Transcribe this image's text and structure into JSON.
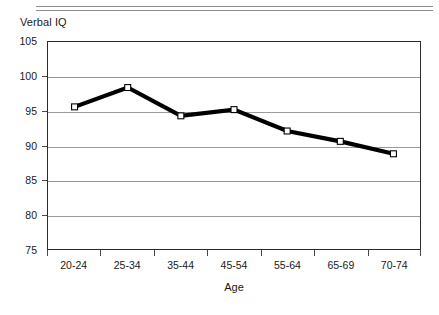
{
  "header": {
    "rule_top": "horizontal-rule",
    "rule_bottom": "horizontal-rule"
  },
  "chart_data": {
    "type": "line",
    "title": "Verbal IQ",
    "xlabel": "Age",
    "ylabel": "Verbal IQ",
    "categories": [
      "20-24",
      "25-34",
      "35-44",
      "45-54",
      "55-64",
      "65-69",
      "70-74"
    ],
    "values": [
      95.6,
      98.4,
      94.3,
      95.2,
      92.1,
      90.6,
      88.8
    ],
    "ylim": [
      75,
      105
    ],
    "ytick_labels": [
      "105",
      "100",
      "95",
      "90",
      "85",
      "80",
      "75"
    ],
    "ytick_values": [
      105,
      100,
      95,
      90,
      85,
      80,
      75
    ],
    "grid": true,
    "legend": null,
    "series_color": "#000000",
    "marker_fill": "#ffffff",
    "marker_shape": "square",
    "gridline_color": "#9a9a9a",
    "axis_color": "#2b2b2b"
  }
}
